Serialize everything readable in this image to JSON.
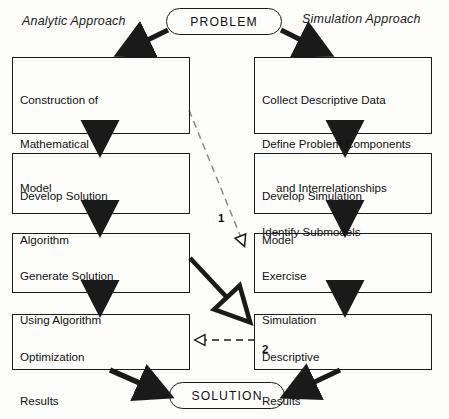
{
  "diagram": {
    "title_left": "Analytic Approach",
    "title_right": "Simulation Approach",
    "start_node": "PROBLEM",
    "end_node": "SOLUTION",
    "colors": {
      "stroke": "#1a1a1a",
      "background": "#fdfdfb",
      "text": "#111111"
    },
    "left_column": [
      {
        "id": "construction",
        "lines": [
          "Construction of",
          "Mathematical",
          "Model"
        ]
      },
      {
        "id": "develop-algorithm",
        "lines": [
          "Develop Solution",
          "Algorithm"
        ]
      },
      {
        "id": "generate-solution",
        "lines": [
          "Generate Solution",
          "Using Algorithm"
        ]
      },
      {
        "id": "optimization-results",
        "lines": [
          "Optimization",
          "Results"
        ]
      }
    ],
    "right_column": [
      {
        "id": "collect-data",
        "lines": [
          "Collect Descriptive Data",
          "Define Problem Components",
          "and Interrelationships",
          "Identify Submodels"
        ],
        "indent_line": 2
      },
      {
        "id": "develop-simulation",
        "lines": [
          "Develop Simulation",
          "Model"
        ]
      },
      {
        "id": "exercise-simulation",
        "lines": [
          "Exercise",
          "Simulation"
        ]
      },
      {
        "id": "descriptive-results",
        "lines": [
          "Descriptive",
          "Results"
        ]
      }
    ],
    "cross_links": [
      {
        "id": "link-1",
        "label": "1",
        "style": "dashed",
        "from": "construction",
        "to": "exercise-simulation"
      },
      {
        "id": "link-2",
        "label": "2",
        "style": "dashed",
        "from": "descriptive-results",
        "to": "optimization-results"
      },
      {
        "id": "link-3",
        "label": "",
        "style": "solid",
        "from": "generate-solution",
        "to": "descriptive-results"
      }
    ]
  }
}
